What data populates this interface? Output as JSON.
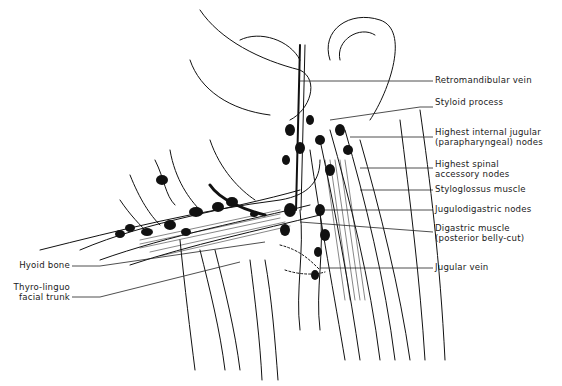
{
  "figure": {
    "type": "anatomical illustration",
    "colors": {
      "ink": "#111111",
      "background": "#ffffff"
    }
  },
  "labels_right": [
    {
      "id": "retromandibular-vein",
      "line1": "Retromandibular vein",
      "line2": ""
    },
    {
      "id": "styloid-process",
      "line1": "Styloid process",
      "line2": ""
    },
    {
      "id": "highest-internal-jugular-nodes",
      "line1": "Highest internal jugular",
      "line2": "(parapharyngeal) nodes"
    },
    {
      "id": "highest-spinal-accessory-nodes",
      "line1": "Highest spinal",
      "line2": "accessory nodes"
    },
    {
      "id": "styloglossus-muscle",
      "line1": "Styloglossus muscle",
      "line2": ""
    },
    {
      "id": "jugulodigastric-nodes",
      "line1": "Jugulodigastric nodes",
      "line2": ""
    },
    {
      "id": "digastric-muscle",
      "line1": "Digastric muscle",
      "line2": "(posterior belly-cut)"
    },
    {
      "id": "jugular-vein",
      "line1": "Jugular vein",
      "line2": ""
    }
  ],
  "labels_left": [
    {
      "id": "hyoid-bone",
      "line1": "Hyoid bone",
      "line2": ""
    },
    {
      "id": "thyro-linguo-facial-trunk",
      "line1": "Thyro-linguo",
      "line2": "facial trunk"
    }
  ]
}
